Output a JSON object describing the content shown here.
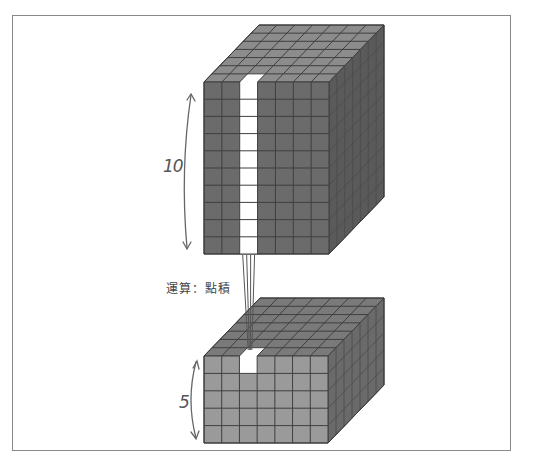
{
  "diagram": {
    "title": "",
    "top_block": {
      "depth_label": "10",
      "front_columns": 7,
      "front_rows": 10,
      "depth_cells": 7,
      "highlight_column": 2,
      "face_color": "#6b6b6b",
      "top_color": "#8c8c8c",
      "side_color": "#5a5a5a",
      "highlight_color": "#ffffff"
    },
    "operation_label": "運算：點積",
    "bottom_block": {
      "depth_label": "5",
      "front_columns": 7,
      "front_rows": 5,
      "depth_cells": 7,
      "highlight_cell": {
        "row": 0,
        "col": 2
      },
      "face_color": "#9a9a9a",
      "top_color": "#7a7a7a",
      "side_color": "#6a6a6a",
      "highlight_color": "#ffffff"
    },
    "frame_color": "#8a8a8a",
    "grid_line_color": "#3f3f3f"
  }
}
